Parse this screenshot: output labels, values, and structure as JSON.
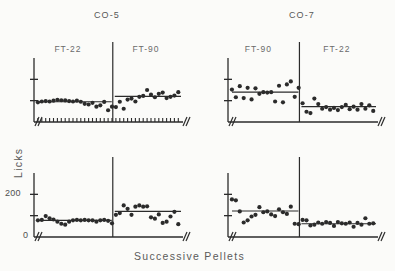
{
  "figure": {
    "y_axis_title": "Licks",
    "x_axis_title": "Successive Pellets",
    "columns": [
      {
        "title": "CO-5"
      },
      {
        "title": "CO-7"
      }
    ]
  },
  "chart_data": {
    "type": "scatter",
    "title": "",
    "xlabel": "Successive Pellets",
    "ylabel": "Licks",
    "grid": false,
    "legend": "none",
    "layout": "2x2 grid of panels; each panel split by a vertical line into two successive conditions; horizontal line in each half shows the condition mean",
    "panels": [
      {
        "panel_id": "top-left",
        "column_title": "CO-5",
        "row": "top",
        "ylim": [
          0,
          300
        ],
        "y_tick_labels": [
          "",
          ""
        ],
        "y_ticks_labeled": false,
        "xlim": [
          0,
          40
        ],
        "axis_break_right": true,
        "phases": [
          {
            "label": "FT-22",
            "mean": 95,
            "x": [
              1,
              2,
              3,
              4,
              5,
              6,
              7,
              8,
              9,
              10,
              11,
              12,
              13,
              14,
              15,
              16,
              17,
              18,
              19,
              20
            ],
            "y": [
              92,
              96,
              98,
              96,
              100,
              104,
              102,
              101,
              98,
              96,
              100,
              95,
              85,
              82,
              90,
              72,
              78,
              94,
              55,
              72
            ]
          },
          {
            "label": "FT-90",
            "mean": 120,
            "x": [
              21,
              22,
              23,
              24,
              25,
              26,
              27,
              28,
              29,
              30,
              31,
              32,
              33,
              34,
              35,
              36,
              37,
              38,
              39,
              40
            ],
            "y": [
              70,
              95,
              62,
              105,
              110,
              96,
              118,
              122,
              150,
              128,
              116,
              132,
              138,
              112,
              118,
              124,
              140,
              126,
              136,
              130
            ]
          }
        ]
      },
      {
        "panel_id": "top-right",
        "column_title": "CO-7",
        "row": "top",
        "ylim": [
          0,
          300
        ],
        "y_tick_labels": [
          "",
          ""
        ],
        "y_ticks_labeled": false,
        "xlim": [
          0,
          40
        ],
        "axis_break_right": true,
        "phases": [
          {
            "label": "FT-90",
            "mean": 140,
            "x": [
              1,
              2,
              3,
              4,
              5,
              6,
              7,
              8,
              9,
              10,
              11,
              12,
              13,
              14,
              15,
              16,
              17,
              18
            ],
            "y": [
              152,
              116,
              168,
              112,
              160,
              106,
              158,
              132,
              140,
              138,
              140,
              96,
              170,
              92,
              176,
              190,
              118,
              160
            ]
          },
          {
            "label": "FT-22",
            "mean": 72,
            "x": [
              19,
              20,
              21,
              22,
              23,
              24,
              25,
              26,
              27,
              28,
              29,
              30,
              31,
              32,
              33,
              34,
              35,
              36,
              37,
              38,
              39,
              40
            ],
            "y": [
              88,
              48,
              42,
              110,
              84,
              62,
              70,
              58,
              66,
              56,
              70,
              80,
              60,
              72,
              58,
              84,
              62,
              78,
              52,
              92,
              96,
              70
            ]
          }
        ]
      },
      {
        "panel_id": "bottom-left",
        "column_title": "CO-5",
        "row": "bottom",
        "ylim": [
          0,
          300
        ],
        "y_tick_labels": [
          "200",
          "0"
        ],
        "y_ticks_labeled": true,
        "xlim": [
          0,
          40
        ],
        "axis_break_right": true,
        "phases": [
          {
            "label": "FT-22",
            "mean": 78,
            "x": [
              1,
              2,
              3,
              4,
              5,
              6,
              7,
              8,
              9,
              10,
              11,
              12,
              13,
              14,
              15,
              16,
              17,
              18,
              19,
              20
            ],
            "y": [
              78,
              80,
              98,
              88,
              82,
              72,
              62,
              58,
              72,
              78,
              80,
              78,
              80,
              78,
              78,
              72,
              78,
              80,
              76,
              64
            ]
          },
          {
            "label": "FT-90",
            "mean": 120,
            "x": [
              21,
              22,
              23,
              24,
              25,
              26,
              27,
              28,
              29,
              30,
              31,
              32,
              33,
              34,
              35,
              36,
              37,
              38,
              39,
              40
            ],
            "y": [
              104,
              112,
              148,
              132,
              104,
              142,
              148,
              142,
              144,
              92,
              86,
              106,
              66,
              72,
              96,
              118,
              60,
              130,
              152,
              162
            ]
          }
        ]
      },
      {
        "panel_id": "bottom-right",
        "column_title": "CO-7",
        "row": "bottom",
        "ylim": [
          0,
          300
        ],
        "y_tick_labels": [
          "",
          ""
        ],
        "y_ticks_labeled": false,
        "xlim": [
          0,
          40
        ],
        "axis_break_right": true,
        "phases": [
          {
            "label": "FT-90",
            "mean": 122,
            "x": [
              1,
              2,
              3,
              4,
              5,
              6,
              7,
              8,
              9,
              10,
              11,
              12,
              13,
              14,
              15,
              16,
              17,
              18
            ],
            "y": [
              176,
              172,
              120,
              68,
              78,
              96,
              104,
              140,
              116,
              120,
              106,
              98,
              130,
              116,
              108,
              142,
              62,
              60
            ]
          },
          {
            "label": "FT-22",
            "mean": 62,
            "x": [
              19,
              20,
              21,
              22,
              23,
              24,
              25,
              26,
              27,
              28,
              29,
              30,
              31,
              32,
              33,
              34,
              35,
              36,
              37,
              38,
              39,
              40
            ],
            "y": [
              80,
              78,
              54,
              58,
              68,
              62,
              70,
              66,
              52,
              70,
              64,
              62,
              68,
              48,
              66,
              58,
              88,
              62,
              64,
              40,
              60,
              66
            ]
          }
        ]
      }
    ]
  }
}
